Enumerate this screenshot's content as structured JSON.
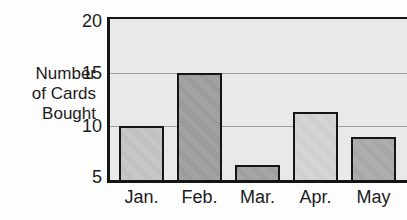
{
  "y_axis": {
    "label_lines": [
      "Number",
      "of Cards",
      "Bought"
    ],
    "tick_labels": [
      "20",
      "15",
      "10",
      "5"
    ]
  },
  "chart_data": {
    "type": "bar",
    "categories": [
      "Jan.",
      "Feb.",
      "Mar.",
      "Apr.",
      "May"
    ],
    "values": [
      10,
      15,
      6.4,
      11.3,
      9
    ],
    "title": "",
    "xlabel": "",
    "ylabel": "Number of Cards Bought",
    "ylim": [
      5,
      20
    ],
    "yticks": [
      20,
      15,
      10,
      5
    ],
    "grid": true,
    "legend": false,
    "colors": {
      "bar_fills": [
        "#c6c6c6",
        "#9e9e9e",
        "#a2a2a2",
        "#d6d6d6",
        "#ababab"
      ],
      "bar_border": "#151515",
      "plot_background": "#e9e9e9",
      "frame": "#151515",
      "gridline": "#9f9f9f",
      "text": "#1c1c1c",
      "page_background": "#fdfdfd"
    }
  }
}
